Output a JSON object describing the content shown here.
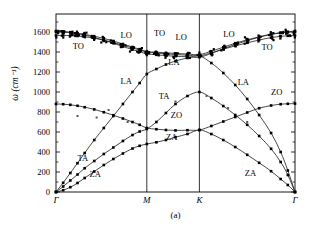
{
  "figure": {
    "caption": "(a)",
    "ylabel_symbol": "ω",
    "ylabel_unit": "(cm⁻¹)",
    "frame_color": "#000000",
    "line_color": "#1a1a1a",
    "marker_color": "#000000",
    "background": "#ffffff"
  },
  "chart_data": {
    "type": "line",
    "title": "",
    "subtitle": "",
    "xlabel": "",
    "ylabel": "ω (cm⁻¹)",
    "ylim": [
      0,
      1780
    ],
    "yticks": [
      0,
      200,
      400,
      600,
      800,
      1000,
      1200,
      1400,
      1600
    ],
    "ytick_labels": [
      "0",
      "200",
      "400",
      "600",
      "800",
      "1000",
      "1200",
      "1400",
      "1600"
    ],
    "grid": false,
    "legend": "none",
    "high_symmetry_points": [
      "Γ",
      "M",
      "K",
      "Γ"
    ],
    "high_symmetry_x": [
      0.0,
      0.38,
      0.6,
      1.0
    ],
    "xlim": [
      0,
      1
    ],
    "annotations": [
      {
        "text": "TO",
        "x": 0.07,
        "y": 1450
      },
      {
        "text": "LO",
        "x": 0.27,
        "y": 1560
      },
      {
        "text": "TO",
        "x": 0.41,
        "y": 1580
      },
      {
        "text": "LO",
        "x": 0.5,
        "y": 1545
      },
      {
        "text": "LO",
        "x": 0.7,
        "y": 1570
      },
      {
        "text": "TO",
        "x": 0.86,
        "y": 1440
      },
      {
        "text": "LA",
        "x": 0.27,
        "y": 1105
      },
      {
        "text": "LA",
        "x": 0.47,
        "y": 1290
      },
      {
        "text": "LA",
        "x": 0.76,
        "y": 1090
      },
      {
        "text": "TA",
        "x": 0.09,
        "y": 330
      },
      {
        "text": "TA",
        "x": 0.43,
        "y": 955
      },
      {
        "text": "ZA",
        "x": 0.14,
        "y": 175
      },
      {
        "text": "ZA",
        "x": 0.46,
        "y": 540
      },
      {
        "text": "ZA",
        "x": 0.79,
        "y": 180
      },
      {
        "text": "ZO",
        "x": 0.48,
        "y": 760
      },
      {
        "text": "ZO",
        "x": 0.9,
        "y": 990
      }
    ],
    "series": [
      {
        "name": "ZA",
        "x": [
          0.0,
          0.03,
          0.06,
          0.09,
          0.12,
          0.16,
          0.2,
          0.24,
          0.28,
          0.32,
          0.35,
          0.38,
          0.42,
          0.46,
          0.5,
          0.55,
          0.6,
          0.65,
          0.7,
          0.75,
          0.8,
          0.85,
          0.9,
          0.94,
          0.97,
          1.0
        ],
        "values": [
          0,
          18,
          48,
          90,
          140,
          205,
          270,
          330,
          385,
          435,
          462,
          480,
          497,
          520,
          548,
          580,
          620,
          580,
          520,
          450,
          372,
          292,
          208,
          130,
          70,
          0
        ]
      },
      {
        "name": "TA",
        "x": [
          0.0,
          0.03,
          0.06,
          0.09,
          0.12,
          0.16,
          0.2,
          0.24,
          0.28,
          0.32,
          0.35,
          0.38,
          0.42,
          0.46,
          0.5,
          0.55,
          0.6,
          0.65,
          0.7,
          0.75,
          0.8,
          0.85,
          0.9,
          0.94,
          0.97,
          1.0
        ],
        "values": [
          0,
          55,
          115,
          175,
          238,
          310,
          380,
          445,
          510,
          570,
          605,
          630,
          700,
          790,
          880,
          960,
          1000,
          940,
          860,
          770,
          672,
          560,
          432,
          300,
          170,
          0
        ]
      },
      {
        "name": "ZO",
        "x": [
          0.0,
          0.03,
          0.06,
          0.09,
          0.12,
          0.16,
          0.2,
          0.24,
          0.28,
          0.32,
          0.35,
          0.38,
          0.42,
          0.46,
          0.5,
          0.55,
          0.6,
          0.65,
          0.7,
          0.75,
          0.8,
          0.85,
          0.9,
          0.94,
          0.97,
          1.0
        ],
        "values": [
          880,
          878,
          872,
          862,
          848,
          826,
          798,
          768,
          735,
          700,
          672,
          640,
          628,
          620,
          616,
          618,
          620,
          660,
          705,
          750,
          795,
          838,
          865,
          878,
          882,
          884
        ]
      },
      {
        "name": "LA",
        "x": [
          0.0,
          0.03,
          0.06,
          0.09,
          0.12,
          0.16,
          0.2,
          0.24,
          0.28,
          0.32,
          0.35,
          0.38,
          0.42,
          0.46,
          0.5,
          0.55,
          0.6,
          0.65,
          0.7,
          0.75,
          0.8,
          0.85,
          0.9,
          0.94,
          0.97,
          1.0
        ],
        "values": [
          0,
          92,
          190,
          288,
          390,
          520,
          640,
          760,
          880,
          1000,
          1090,
          1180,
          1230,
          1275,
          1310,
          1340,
          1360,
          1290,
          1190,
          1070,
          930,
          770,
          590,
          400,
          215,
          0
        ]
      },
      {
        "name": "TO",
        "x": [
          0.0,
          0.03,
          0.06,
          0.09,
          0.12,
          0.16,
          0.2,
          0.24,
          0.28,
          0.32,
          0.35,
          0.38,
          0.42,
          0.46,
          0.5,
          0.55,
          0.6,
          0.65,
          0.7,
          0.75,
          0.8,
          0.85,
          0.9,
          0.94,
          0.97,
          1.0
        ],
        "values": [
          1565,
          1566,
          1565,
          1560,
          1552,
          1538,
          1518,
          1495,
          1468,
          1440,
          1420,
          1400,
          1390,
          1382,
          1375,
          1368,
          1362,
          1392,
          1428,
          1462,
          1492,
          1520,
          1544,
          1556,
          1562,
          1565
        ]
      },
      {
        "name": "LO",
        "x": [
          0.0,
          0.03,
          0.06,
          0.09,
          0.12,
          0.16,
          0.2,
          0.24,
          0.28,
          0.32,
          0.35,
          0.38,
          0.42,
          0.46,
          0.5,
          0.55,
          0.6,
          0.65,
          0.7,
          0.75,
          0.8,
          0.85,
          0.9,
          0.94,
          0.97,
          1.0
        ],
        "values": [
          1600,
          1598,
          1594,
          1586,
          1575,
          1558,
          1536,
          1510,
          1480,
          1450,
          1428,
          1405,
          1398,
          1392,
          1386,
          1380,
          1374,
          1408,
          1448,
          1488,
          1522,
          1552,
          1578,
          1592,
          1598,
          1601
        ]
      },
      {
        "name": "LO2",
        "x": [
          0.0,
          0.03,
          0.06,
          0.09,
          0.12,
          0.16,
          0.2,
          0.24,
          0.28,
          0.32,
          0.35,
          0.38,
          0.42,
          0.46,
          0.5,
          0.55,
          0.6,
          0.65,
          0.7,
          0.75,
          0.8,
          0.85,
          0.9,
          0.94,
          0.97,
          1.0
        ],
        "values": [
          1610,
          1606,
          1598,
          1586,
          1570,
          1546,
          1518,
          1488,
          1455,
          1424,
          1402,
          1382,
          1372,
          1364,
          1358,
          1352,
          1348,
          1386,
          1432,
          1476,
          1514,
          1548,
          1576,
          1592,
          1602,
          1610
        ]
      }
    ]
  }
}
